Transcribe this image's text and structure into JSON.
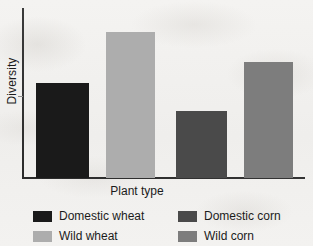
{
  "chart_data": {
    "type": "bar",
    "title": "",
    "xlabel": "Plant type",
    "ylabel": "Diversity",
    "categories": [
      "Domestic wheat",
      "Wild wheat",
      "Domestic corn",
      "Wild corn"
    ],
    "values": [
      95,
      146,
      67,
      116
    ],
    "value_unit": "relative pixel height (axis unlabeled)",
    "ylim": [
      0,
      170
    ],
    "yticks": [],
    "xticks": [],
    "grid": false,
    "legend_position": "below-axis-two-columns",
    "series": [
      {
        "name": "Diversity",
        "values": [
          95,
          146,
          67,
          116
        ]
      }
    ],
    "bars": [
      {
        "label": "Domestic wheat",
        "value": 95,
        "color": "#1a1a1a",
        "left": 36,
        "width": 53,
        "top": 83
      },
      {
        "label": "Wild wheat",
        "value": 146,
        "color": "#adadad",
        "left": 106,
        "width": 49,
        "top": 32
      },
      {
        "label": "Domestic corn",
        "value": 67,
        "color": "#4a4a4a",
        "left": 176,
        "width": 51,
        "top": 111
      },
      {
        "label": "Wild corn",
        "value": 116,
        "color": "#7d7d7d",
        "left": 244,
        "width": 49,
        "top": 62
      }
    ]
  },
  "axes": {
    "y_title": "Diversity",
    "x_title": "Plant type"
  },
  "legend": {
    "items": [
      {
        "label": "Domestic wheat",
        "color": "#1a1a1a"
      },
      {
        "label": "Domestic corn",
        "color": "#4a4a4a"
      },
      {
        "label": "Wild wheat",
        "color": "#adadad"
      },
      {
        "label": "Wild corn",
        "color": "#7d7d7d"
      }
    ]
  },
  "colors": {
    "page_background": "#f2f1ef",
    "axis": "#2a2a2a",
    "text": "#1b1b1b",
    "domestic_wheat": "#1a1a1a",
    "wild_wheat": "#adadad",
    "domestic_corn": "#4a4a4a",
    "wild_corn": "#7d7d7d"
  }
}
